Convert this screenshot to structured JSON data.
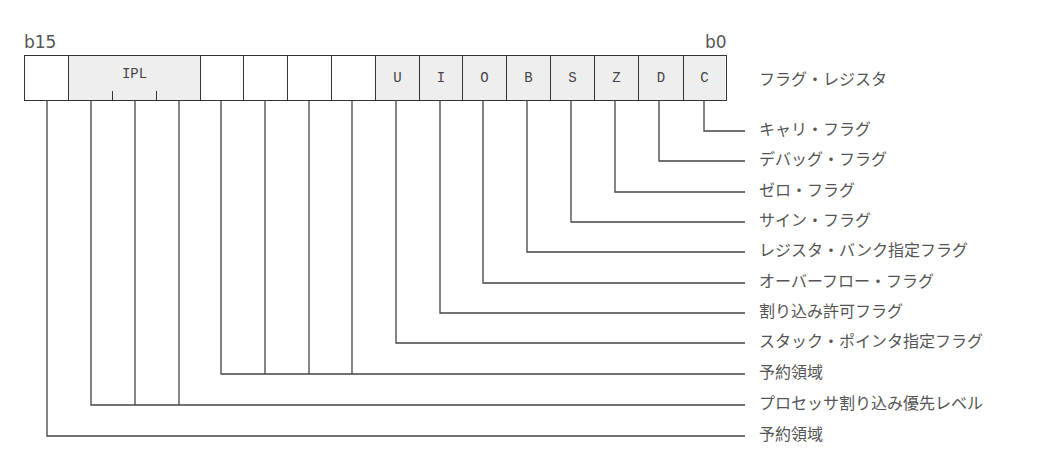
{
  "diagram": {
    "type": "bit-field register diagram",
    "msb_label": "b15",
    "lsb_label": "b0",
    "register_name": "フラグ・レジスタ",
    "fields": [
      {
        "bits": "b15",
        "label": "",
        "shaded": false
      },
      {
        "bits": "b14-b12",
        "label": "IPL",
        "shaded": true
      },
      {
        "bits": "b11",
        "label": "",
        "shaded": false
      },
      {
        "bits": "b10",
        "label": "",
        "shaded": false
      },
      {
        "bits": "b9",
        "label": "",
        "shaded": false
      },
      {
        "bits": "b8",
        "label": "",
        "shaded": false
      },
      {
        "bits": "b7",
        "label": "U",
        "shaded": true
      },
      {
        "bits": "b6",
        "label": "I",
        "shaded": true
      },
      {
        "bits": "b5",
        "label": "O",
        "shaded": true
      },
      {
        "bits": "b4",
        "label": "B",
        "shaded": true
      },
      {
        "bits": "b3",
        "label": "S",
        "shaded": true
      },
      {
        "bits": "b2",
        "label": "Z",
        "shaded": true
      },
      {
        "bits": "b1",
        "label": "D",
        "shaded": true
      },
      {
        "bits": "b0",
        "label": "C",
        "shaded": true
      }
    ],
    "descriptions": [
      {
        "bit": "C",
        "text": "キャリ・フラグ"
      },
      {
        "bit": "D",
        "text": "デバッグ・フラグ"
      },
      {
        "bit": "Z",
        "text": "ゼロ・フラグ"
      },
      {
        "bit": "S",
        "text": "サイン・フラグ"
      },
      {
        "bit": "B",
        "text": "レジスタ・バンク指定フラグ"
      },
      {
        "bit": "O",
        "text": "オーバーフロー・フラグ"
      },
      {
        "bit": "I",
        "text": "割り込み許可フラグ"
      },
      {
        "bit": "U",
        "text": "スタック・ポインタ指定フラグ"
      },
      {
        "bit": "b11-b8",
        "text": "予約領域"
      },
      {
        "bit": "IPL",
        "text": "プロセッサ割り込み優先レベル"
      },
      {
        "bit": "b15",
        "text": "予約領域"
      }
    ]
  }
}
